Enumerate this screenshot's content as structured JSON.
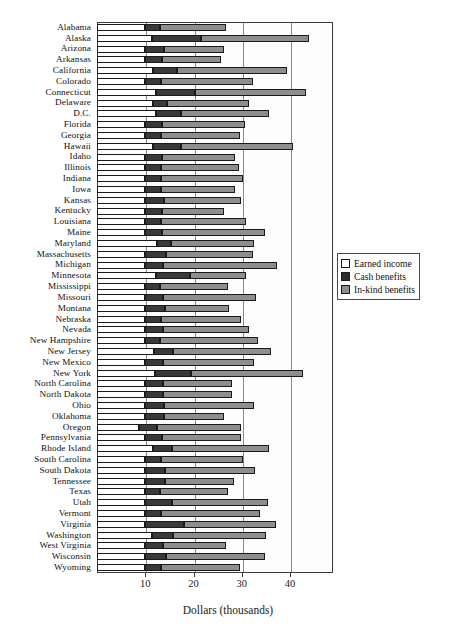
{
  "chart_data": {
    "type": "bar",
    "orientation": "horizontal",
    "stacked": true,
    "title": "",
    "xlabel": "Dollars (thousands)",
    "ylabel": "",
    "xlim": [
      0,
      48.9
    ],
    "xticks": [
      10,
      20,
      30,
      40
    ],
    "xticklabels": [
      "10",
      "20",
      "30",
      "40"
    ],
    "grid": "vertical",
    "legend_position": "right-middle",
    "legend": [
      "Earned income",
      "Cash benefits",
      "In-kind benefits"
    ],
    "series": [
      {
        "name": "Earned income",
        "color": "#ffffff",
        "values": [
          10.0,
          11.3,
          10.0,
          10.0,
          11.6,
          10.0,
          12.2,
          11.6,
          12.3,
          10.0,
          10.0,
          11.6,
          10.0,
          10.0,
          10.0,
          10.0,
          10.0,
          10.0,
          10.0,
          10.0,
          12.4,
          10.0,
          10.0,
          12.3,
          10.0,
          10.0,
          10.0,
          10.0,
          10.0,
          10.0,
          11.9,
          10.0,
          12.1,
          10.0,
          10.0,
          10.0,
          10.0,
          8.7,
          10.0,
          11.5,
          10.0,
          10.0,
          10.0,
          10.0,
          10.0,
          10.0,
          10.0,
          11.4,
          10.0,
          10.0,
          10.0
        ]
      },
      {
        "name": "Cash benefits",
        "color": "#3a3a3a",
        "values": [
          3.1,
          10.3,
          3.8,
          3.5,
          5.0,
          3.3,
          8.1,
          3.0,
          5.1,
          3.5,
          3.2,
          5.9,
          3.5,
          3.3,
          3.3,
          3.3,
          3.8,
          3.5,
          3.3,
          3.4,
          3.0,
          4.2,
          3.6,
          6.9,
          3.1,
          3.6,
          4.0,
          3.3,
          3.7,
          3.1,
          3.8,
          3.7,
          7.4,
          3.7,
          3.6,
          3.9,
          3.9,
          3.8,
          3.4,
          4.1,
          3.2,
          4.1,
          4.0,
          3.1,
          5.6,
          3.2,
          8.1,
          4.3,
          3.6,
          4.2,
          3.3
        ]
      },
      {
        "name": "In-kind benefits",
        "color": "#8e8e8e",
        "values": [
          13.6,
          22.4,
          12.6,
          12.1,
          22.8,
          19.0,
          23.1,
          16.9,
          18.2,
          17.2,
          16.4,
          23.1,
          15.1,
          16.1,
          17.0,
          15.2,
          16.0,
          12.9,
          17.5,
          21.5,
          17.1,
          18.1,
          23.7,
          11.6,
          14.1,
          19.3,
          13.3,
          16.6,
          17.7,
          20.2,
          20.3,
          18.9,
          23.2,
          14.3,
          14.3,
          18.7,
          12.5,
          17.4,
          16.4,
          20.1,
          17.1,
          18.6,
          14.3,
          14.0,
          19.9,
          20.6,
          18.9,
          19.3,
          13.1,
          20.7,
          16.4
        ]
      }
    ],
    "categories": [
      "Alabama",
      "Alaska",
      "Arizona",
      "Arkansas",
      "California",
      "Colorado",
      "Connecticut",
      "Delaware",
      "D.C.",
      "Florida",
      "Georgia",
      "Hawaii",
      "Idaho",
      "Illinois",
      "Indiana",
      "Iowa",
      "Kansas",
      "Kentucky",
      "Louisiana",
      "Maine",
      "Maryland",
      "Massachusetts",
      "Michigan",
      "Minnesota",
      "Mississippi",
      "Missouri",
      "Montana",
      "Nebraska",
      "Nevada",
      "New Hampshire",
      "New Jersey",
      "New Mexico",
      "New York",
      "North Carolina",
      "North Dakota",
      "Ohio",
      "Oklahoma",
      "Oregon",
      "Pennsylvania",
      "Rhode Island",
      "South Carolina",
      "South Dakota",
      "Tennessee",
      "Texas",
      "Utah",
      "Vermont",
      "Virginia",
      "Washington",
      "West Virginia",
      "Wisconsin",
      "Wyoming"
    ]
  },
  "axis": {
    "x_title": "Dollars (thousands)"
  },
  "legend": {
    "items": [
      {
        "label": "Earned income",
        "swatch": "white-square-icon"
      },
      {
        "label": "Cash benefits",
        "swatch": "black-square-icon"
      },
      {
        "label": "In-kind benefits",
        "swatch": "gray-square-icon"
      }
    ]
  },
  "colors": {
    "earned_income": "#ffffff",
    "cash_benefits": "#3a3a3a",
    "in_kind_benefits": "#8e8e8e",
    "axis": "#3a3a3a",
    "gridline": "#8a8a8a"
  }
}
